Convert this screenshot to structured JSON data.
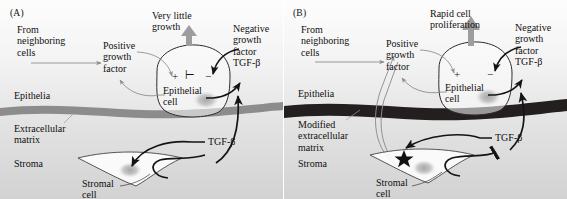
{
  "figure": {
    "type": "biological-schematic",
    "title_absent": true,
    "panels": [
      {
        "id": "A",
        "label": "(A)",
        "condition": "normal-stroma",
        "labels": {
          "from_neighboring_cells": "From\nneighboring\ncells",
          "positive_growth_factor": "Positive\ngrowth\nfactor",
          "growth_outcome": "Very little\ngrowth",
          "negative_growth_factor": "Negative\ngrowth\nfactor\nTGF-β",
          "epithelial_cell": "Epithelial\ncell",
          "epithelia": "Epithelia",
          "extracellular_matrix": "Extracellular\nmatrix",
          "stroma": "Stroma",
          "stromal_cell": "Stromal\ncell",
          "tgf_beta": "TGF-β"
        },
        "cell_symbols": [
          "+",
          "⊢",
          "−"
        ],
        "signal_integration": "positive-signal-blocked-by-negative",
        "matrix_state": "normal",
        "stromal_cell_mutation": false,
        "tgf_beta_feedback_to_stroma": "arrowhead",
        "growth_arrow_size": "small"
      },
      {
        "id": "B",
        "label": "(B)",
        "condition": "activated-mutant-stroma",
        "labels": {
          "from_neighboring_cells": "From\nneighboring\ncells",
          "positive_growth_factor": "Positive\ngrowth\nfactor",
          "growth_outcome": "Rapid cell\nproliferation",
          "negative_growth_factor": "Negative\ngrowth\nfactor\nTGF-β",
          "epithelial_cell": "Epithelial\ncell",
          "epithelia": "Epithelia",
          "extracellular_matrix": "Modified\nextracellular\nmatrix",
          "stroma": "Stroma",
          "stromal_cell": "Stromal\ncell",
          "tgf_beta": "TGF-β"
        },
        "cell_symbols": [
          "+",
          "−"
        ],
        "signal_integration": "inhibitory-link-absent",
        "matrix_state": "modified",
        "stromal_cell_mutation": true,
        "tgf_beta_feedback_to_stroma": "blunt-inhibition-bar",
        "growth_arrow_size": "large"
      }
    ],
    "colors": {
      "ink": "#100f0f",
      "black_arrow": "#141414",
      "gray_arrow": "#8d8d8d",
      "growth_arrow": "#9a9a9a",
      "matrix_normal": "#8c8c8c",
      "matrix_modified": "#241f1f",
      "cell_outline": "#2b2b2b",
      "nucleus": "#b9b9b9"
    }
  }
}
